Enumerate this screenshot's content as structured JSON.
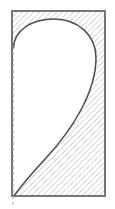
{
  "figure": {
    "canvas": {
      "width": 115,
      "height": 209
    },
    "colors": {
      "background": "#ffffff",
      "outline": "#555555",
      "hatch_line": "#b4b4b4",
      "hatch_background": "#ffffff",
      "cutout_fill": "#ffffff",
      "cutout_outline": "#4a4a4a",
      "dashed_axis": "#9a9a9a"
    },
    "rectangle": {
      "name": "hatched-boundary-rectangle",
      "x": 12,
      "y": 11,
      "width": 93,
      "height": 185,
      "stroke_width": 1.6,
      "hatch_angle_degrees": 45,
      "hatch_spacing": 4
    },
    "cutout": {
      "name": "teardrop-cutout-region",
      "path": "M 13.5 48 C 14 30 32 19 54 19 C 78 19 96 35 96 58 C 96 92 72 130 46 158 C 34 171 22 185 14.5 195 L 13.5 195 Z",
      "stroke_width": 1.5,
      "apex_point": {
        "x": 60,
        "y": 19
      },
      "rightmost_point": {
        "x": 96,
        "y": 58
      },
      "tail_point": {
        "x": 14,
        "y": 195
      },
      "start_point": {
        "x": 13,
        "y": 48
      }
    },
    "dashed_axis": {
      "name": "vertical-center-axis",
      "x": 13,
      "y_start": 46,
      "y_end": 205,
      "stroke_width": 1,
      "dash_pattern": "3 3"
    }
  }
}
